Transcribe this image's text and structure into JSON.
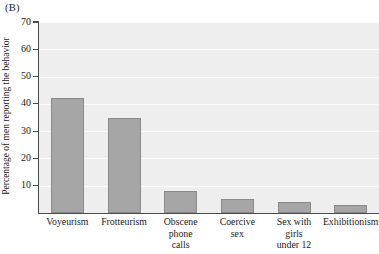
{
  "panel": {
    "label": "(B)"
  },
  "chart_data": {
    "type": "bar",
    "title": "",
    "subtitle": "",
    "panel_label": "(B)",
    "xlabel": "",
    "ylabel": "Percentage of men reporting the behavior",
    "categories": [
      "Voyeurism",
      "Frotteurism",
      "Obscene phone calls",
      "Coercive sex",
      "Sex with girls under 12",
      "Exhibitionism"
    ],
    "category_lines": [
      [
        "Voyeurism"
      ],
      [
        "Frotteurism"
      ],
      [
        "Obscene",
        "phone",
        "calls"
      ],
      [
        "Coercive",
        "sex"
      ],
      [
        "Sex with",
        "girls",
        "under 12"
      ],
      [
        "Exhibitionism"
      ]
    ],
    "values": [
      42,
      35,
      8,
      5,
      4,
      3
    ],
    "ylim": [
      0,
      70
    ],
    "yticks": [
      10,
      20,
      30,
      40,
      50,
      60,
      70
    ],
    "ytick_labels": [
      "10",
      "20",
      "30",
      "40",
      "50",
      "60",
      "70"
    ],
    "grid": true,
    "grid_axis": "y",
    "legend": null,
    "legend_position": "none",
    "bar_color": "#a6a6a6",
    "bar_edge_color": "#8a8a8a",
    "plot_background": "#eeeeee",
    "gridline_color": "#fbfbfb",
    "axis_color": "#4a4a4a"
  },
  "axis": {
    "y_title": "Percentage of men reporting the behavior",
    "y_tick_labels": [
      "70",
      "60",
      "50",
      "40",
      "30",
      "20",
      "10"
    ]
  }
}
